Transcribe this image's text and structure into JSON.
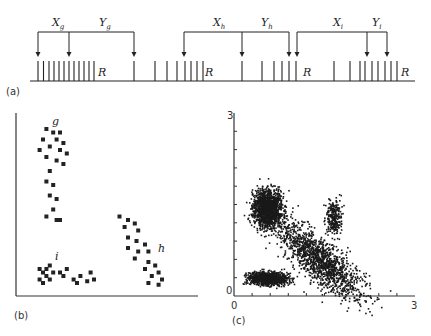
{
  "panel_a": {
    "label": "(a)",
    "baseline": {
      "x1": 30,
      "x2": 415,
      "y": 81
    },
    "spike_top": 61,
    "spikes": [
      38,
      43.5,
      49,
      54,
      59,
      64,
      69,
      74,
      79,
      84,
      89,
      94,
      134,
      155,
      167,
      177,
      185,
      191,
      197,
      203,
      242,
      262,
      274,
      282,
      289,
      296,
      334,
      350,
      360,
      365,
      372,
      378,
      385,
      391,
      397
    ],
    "reset_labels": [
      {
        "text": "R",
        "x": 98,
        "y": 76
      },
      {
        "text": "R",
        "x": 205,
        "y": 76
      },
      {
        "text": "R",
        "x": 303,
        "y": 76
      },
      {
        "text": "R",
        "x": 401,
        "y": 76
      }
    ],
    "brackets": [
      {
        "from": 38,
        "mid": 69,
        "to": 134,
        "y": 32,
        "labelX": "X",
        "subX": "g",
        "labelY": "Y",
        "subY": "g",
        "xPos": 52,
        "yPos": 99
      },
      {
        "from": 184,
        "mid": 242,
        "to": 289,
        "y": 32,
        "labelX": "X",
        "subX": "h",
        "labelY": "Y",
        "subY": "h",
        "xPos": 213,
        "yPos": 261
      },
      {
        "from": 297,
        "mid": 367,
        "to": 387,
        "y": 32,
        "labelX": "X",
        "subX": "i",
        "labelY": "Y",
        "subY": "i",
        "xPos": 333,
        "yPos": 372
      }
    ]
  },
  "panel_b": {
    "label": "(b)",
    "cluster_labels": [
      {
        "text": "g",
        "x": 52,
        "y": 125
      },
      {
        "text": "h",
        "x": 158,
        "y": 252
      },
      {
        "text": "i",
        "x": 55,
        "y": 260
      }
    ]
  },
  "panel_c": {
    "label": "(c)",
    "x_tick_labels": [
      "0",
      "3"
    ],
    "y_tick_labels": [
      "0",
      "3"
    ]
  },
  "chart_data": [
    {
      "type": "scatter",
      "title": "(b)",
      "xlabel": "",
      "ylabel": "",
      "series": [
        {
          "name": "g",
          "points": [
            [
              0.12,
              0.92
            ],
            [
              0.16,
              0.9
            ],
            [
              0.2,
              0.9
            ],
            [
              0.1,
              0.86
            ],
            [
              0.18,
              0.86
            ],
            [
              0.22,
              0.84
            ],
            [
              0.14,
              0.82
            ],
            [
              0.08,
              0.8
            ],
            [
              0.2,
              0.8
            ],
            [
              0.24,
              0.78
            ],
            [
              0.12,
              0.76
            ],
            [
              0.18,
              0.74
            ],
            [
              0.22,
              0.72
            ],
            [
              0.14,
              0.68
            ],
            [
              0.12,
              0.62
            ],
            [
              0.16,
              0.6
            ],
            [
              0.14,
              0.54
            ],
            [
              0.18,
              0.52
            ],
            [
              0.16,
              0.46
            ],
            [
              0.12,
              0.42
            ],
            [
              0.18,
              0.4
            ],
            [
              0.2,
              0.4
            ]
          ]
        },
        {
          "name": "h",
          "points": [
            [
              0.55,
              0.42
            ],
            [
              0.6,
              0.4
            ],
            [
              0.64,
              0.38
            ],
            [
              0.58,
              0.36
            ],
            [
              0.66,
              0.34
            ],
            [
              0.6,
              0.3
            ],
            [
              0.65,
              0.28
            ],
            [
              0.7,
              0.26
            ],
            [
              0.6,
              0.24
            ],
            [
              0.66,
              0.22
            ],
            [
              0.72,
              0.22
            ],
            [
              0.64,
              0.18
            ],
            [
              0.72,
              0.16
            ],
            [
              0.76,
              0.14
            ],
            [
              0.7,
              0.12
            ],
            [
              0.78,
              0.1
            ],
            [
              0.74,
              0.08
            ],
            [
              0.8,
              0.06
            ],
            [
              0.72,
              0.04
            ],
            [
              0.78,
              0.03
            ]
          ]
        },
        {
          "name": "i",
          "points": [
            [
              0.08,
              0.12
            ],
            [
              0.12,
              0.12
            ],
            [
              0.14,
              0.14
            ],
            [
              0.1,
              0.1
            ],
            [
              0.16,
              0.1
            ],
            [
              0.12,
              0.08
            ],
            [
              0.08,
              0.06
            ],
            [
              0.14,
              0.06
            ],
            [
              0.1,
              0.04
            ],
            [
              0.2,
              0.1
            ],
            [
              0.24,
              0.12
            ],
            [
              0.22,
              0.08
            ],
            [
              0.28,
              0.06
            ],
            [
              0.32,
              0.08
            ],
            [
              0.36,
              0.05
            ],
            [
              0.4,
              0.06
            ],
            [
              0.3,
              0.04
            ],
            [
              0.38,
              0.1
            ]
          ]
        }
      ]
    },
    {
      "type": "scatter",
      "title": "(c)",
      "xlabel": "",
      "ylabel": "",
      "xlim": [
        0,
        3
      ],
      "ylim": [
        0,
        3
      ],
      "x_ticks": [
        "0",
        "3"
      ],
      "y_ticks": [
        "0",
        "3"
      ],
      "clusters": [
        {
          "center": [
            0.55,
            1.45
          ],
          "spread": [
            0.22,
            0.28
          ],
          "density": "very high"
        },
        {
          "center": [
            0.55,
            0.3
          ],
          "spread": [
            0.3,
            0.1
          ],
          "density": "high"
        },
        {
          "center": [
            1.4,
            0.6
          ],
          "spread": [
            0.3,
            0.25
          ],
          "density": "very high",
          "orientation": "diagonal"
        },
        {
          "center": [
            1.65,
            1.3
          ],
          "spread": [
            0.12,
            0.25
          ],
          "density": "medium"
        }
      ]
    }
  ]
}
